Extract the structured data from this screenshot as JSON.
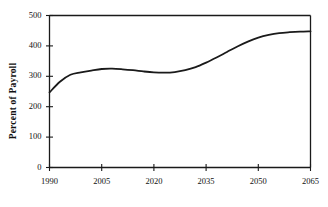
{
  "chart_data": {
    "type": "line",
    "title": "",
    "subtitle": "",
    "xlabel": "",
    "ylabel": "Percent of Payroll",
    "xlim": [
      1990,
      2065
    ],
    "ylim": [
      0,
      500
    ],
    "grid": false,
    "legend": null,
    "xticks": [
      1990,
      2005,
      2020,
      2035,
      2050,
      2065
    ],
    "xtick_labels": [
      "1990",
      "2005",
      "2020",
      "2035",
      "2050",
      "2065"
    ],
    "yticks": [
      0,
      100,
      200,
      300,
      400,
      500
    ],
    "ytick_labels": [
      "0",
      "100",
      "200",
      "300",
      "400",
      "500"
    ],
    "line_color": "#1a1a1a",
    "line_width": 1.8,
    "series": [
      {
        "name": "Percent of Payroll",
        "x": [
          1990,
          1993,
          1996,
          1999,
          2002,
          2005,
          2008,
          2011,
          2014,
          2017,
          2020,
          2023,
          2026,
          2029,
          2032,
          2035,
          2038,
          2041,
          2044,
          2047,
          2050,
          2053,
          2056,
          2059,
          2062,
          2065
        ],
        "values": [
          247,
          282,
          305,
          313,
          319,
          324,
          325,
          323,
          320,
          316,
          313,
          312,
          314,
          320,
          330,
          345,
          362,
          380,
          398,
          414,
          427,
          436,
          442,
          445,
          447,
          448
        ]
      }
    ],
    "annotations": []
  },
  "axes": {
    "frame_color": "#1a1a1a",
    "tick_color": "#1a1a1a"
  }
}
